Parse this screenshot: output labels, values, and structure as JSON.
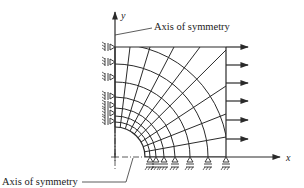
{
  "figure": {
    "type": "finite-element mesh of quarter plate with circular hole",
    "axes": {
      "x_label": "x",
      "y_label": "y"
    },
    "annotations": [
      {
        "id": "top",
        "text": "Axis of symmetry"
      },
      {
        "id": "bottom",
        "text": "Axis of symmetry"
      }
    ],
    "boundary_conditions": {
      "left_edge": "roller supports (symmetry about y-axis)",
      "bottom_edge": "roller supports (symmetry about x-axis)",
      "right_edge": "applied tensile load arrows"
    },
    "load_arrow_count": 5,
    "left_support_count": 7,
    "bottom_support_count": 6
  }
}
